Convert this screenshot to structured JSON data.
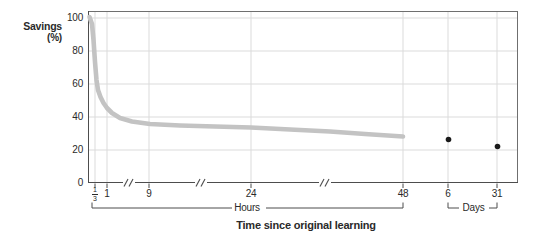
{
  "labels": {
    "y_title_line1": "Savings",
    "y_title_line2": "(%)",
    "hours_group": "Hours",
    "days_group": "Days",
    "x_title": "Time since original learning"
  },
  "colors": {
    "background": "#ffffff",
    "grid": "#dbdbdb",
    "frame": "#6f6f6f",
    "axis": "#4d4d4d",
    "curve": "#c3c3c3",
    "dot": "#1a1a1a",
    "bracket": "#4d4d4d",
    "text": "#2a2a2a"
  },
  "chart_data": {
    "type": "line",
    "title": "",
    "xlabel": "Time since original learning",
    "ylabel": "Savings (%)",
    "ylim": [
      0,
      100
    ],
    "yticks": [
      0,
      20,
      40,
      60,
      80,
      100
    ],
    "grid": "both",
    "x_axis_groups": [
      {
        "group": "Hours",
        "tick_labels": [
          "1/3",
          "1",
          "9",
          "24",
          "48"
        ]
      },
      {
        "group": "Days",
        "tick_labels": [
          "6",
          "31"
        ]
      }
    ],
    "axis_break_count": 3,
    "series": [
      {
        "name": "forgetting-curve",
        "type": "line",
        "x_unit": "hours",
        "points": [
          {
            "x": 0,
            "savings": 100
          },
          {
            "x": 0.33,
            "savings": 58
          },
          {
            "x": 1,
            "savings": 45
          },
          {
            "x": 9,
            "savings": 36
          },
          {
            "x": 24,
            "savings": 34
          },
          {
            "x": 48,
            "savings": 28
          }
        ]
      },
      {
        "name": "day-observations",
        "type": "scatter",
        "x_unit": "days",
        "points": [
          {
            "x": 6,
            "savings": 26
          },
          {
            "x": 31,
            "savings": 22
          }
        ]
      }
    ],
    "layout": {
      "plot": {
        "left": 88,
        "top": 11,
        "right": 518,
        "bottom": 183
      },
      "px_per_unit_y": 1.65,
      "x_ticks": [
        {
          "label": "1/3",
          "fraction": {
            "num": "1",
            "den": "3"
          },
          "x": 95
        },
        {
          "label": "1",
          "x": 107
        },
        {
          "label": "9",
          "x": 149
        },
        {
          "label": "24",
          "x": 251
        },
        {
          "label": "48",
          "x": 403
        },
        {
          "label": "6",
          "x": 448
        },
        {
          "label": "31",
          "x": 497
        }
      ],
      "break_xs": [
        129,
        201,
        325
      ],
      "curve_px": [
        [
          89.5,
          17
        ],
        [
          92,
          24
        ],
        [
          93.5,
          40
        ],
        [
          95,
          62
        ],
        [
          96.5,
          80
        ],
        [
          98,
          90
        ],
        [
          100.5,
          97
        ],
        [
          103.5,
          103
        ],
        [
          107,
          108
        ],
        [
          112,
          113
        ],
        [
          120,
          118
        ],
        [
          132,
          121.5
        ],
        [
          150,
          124
        ],
        [
          180,
          125.5
        ],
        [
          215,
          126.5
        ],
        [
          251,
          127.5
        ],
        [
          290,
          129.5
        ],
        [
          330,
          131.5
        ],
        [
          365,
          134
        ],
        [
          403,
          136.5
        ]
      ],
      "curve_width": 4.6,
      "dots_px": [
        [
          448.5,
          139.5
        ],
        [
          497.5,
          146.5
        ]
      ],
      "dot_radius": 2.8,
      "hours_bracket": {
        "x1": 92,
        "x2": 403,
        "y": 208,
        "riser_top": 202.5,
        "gap": [
          232,
          266
        ]
      },
      "days_bracket": {
        "x1": 448,
        "x2": 497,
        "y": 208,
        "riser_top": 202.5,
        "gap": [
          459,
          489
        ]
      }
    }
  }
}
